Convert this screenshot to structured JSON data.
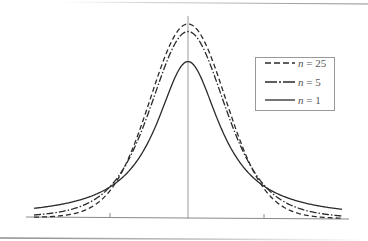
{
  "chart_data": {
    "type": "line",
    "title": "",
    "xlabel": "",
    "ylabel": "",
    "xlim": [
      -4,
      4
    ],
    "ylim": [
      0,
      0.42
    ],
    "x_ticks": [
      -2,
      0,
      2
    ],
    "x_tick_labels": [],
    "grid": false,
    "legend_position": "upper right",
    "series": [
      {
        "name": "n = 25",
        "var": "n",
        "value": "25",
        "style": "dashed",
        "dof": 25,
        "peak": 0.394
      },
      {
        "name": "n = 5",
        "var": "n",
        "value": "5",
        "style": "dash-dot",
        "dof": 5,
        "peak": 0.38
      },
      {
        "name": "n = 1",
        "var": "n",
        "value": "1",
        "style": "solid",
        "dof": 1,
        "peak": 0.318
      }
    ],
    "sample_points": {
      "x": [
        -4,
        -3,
        -2,
        -1,
        0,
        1,
        2,
        3,
        4
      ],
      "n=25": [
        0.0005,
        0.0058,
        0.0549,
        0.2396,
        0.394,
        0.2396,
        0.0549,
        0.0058,
        0.0005
      ],
      "n=5": [
        0.0051,
        0.0173,
        0.0651,
        0.2197,
        0.3796,
        0.2197,
        0.0651,
        0.0173,
        0.0051
      ],
      "n=1": [
        0.0187,
        0.0318,
        0.0637,
        0.1592,
        0.3183,
        0.1592,
        0.0637,
        0.0318,
        0.0187
      ]
    }
  },
  "legend": {
    "items": [
      {
        "var": "n",
        "eq": " = ",
        "value": "25"
      },
      {
        "var": "n",
        "eq": " = ",
        "value": "5"
      },
      {
        "var": "n",
        "eq": " = ",
        "value": "1"
      }
    ]
  },
  "colors": {
    "curve": "#2b2b2b",
    "axis": "#8a8a8a",
    "legend_border": "#999999",
    "frame_line": "#8c8c8c"
  }
}
